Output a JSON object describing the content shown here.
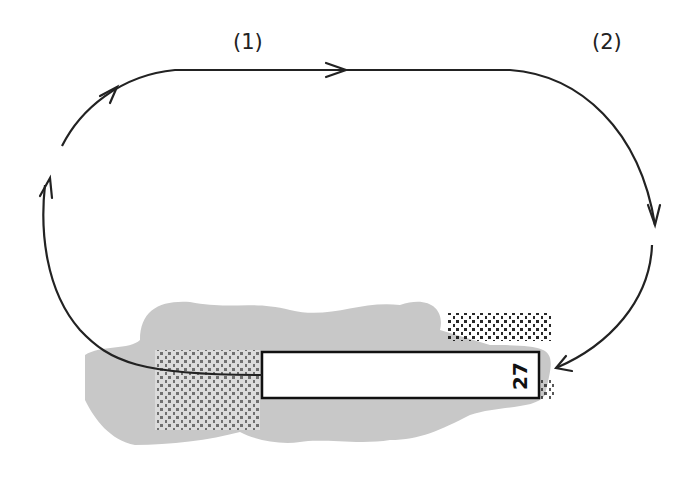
{
  "diagram": {
    "labels": {
      "leg1": "(1)",
      "leg2": "(2)",
      "runway_number": "27"
    },
    "colors": {
      "line": "#222222",
      "terrain": "#c8c8c8",
      "runway_fill": "#ffffff",
      "runway_border": "#111111"
    }
  }
}
